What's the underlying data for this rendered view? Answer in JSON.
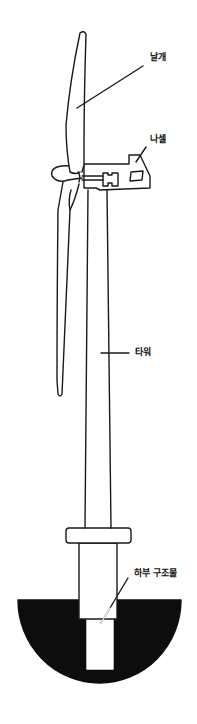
{
  "diagram": {
    "colors": {
      "stroke": "#1a1a1a",
      "fill_background": "#ffffff",
      "foundation_fill": "#0d0d0d"
    },
    "labels": [
      {
        "id": "blade",
        "text": "날개",
        "meaning": "Blade"
      },
      {
        "id": "nacelle",
        "text": "나셀",
        "meaning": "Nacelle"
      },
      {
        "id": "tower",
        "text": "타워",
        "meaning": "Tower"
      },
      {
        "id": "substructure",
        "text": "하부 구조물",
        "meaning": "Substructure"
      }
    ]
  }
}
